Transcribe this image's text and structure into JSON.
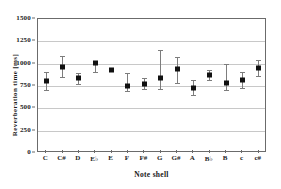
{
  "chart_data": {
    "type": "scatter",
    "title": "",
    "xlabel": "Note shell",
    "ylabel": "Reverberation time [ms]",
    "ylim": [
      0,
      1500
    ],
    "yticks": [
      0,
      250,
      500,
      750,
      1000,
      1250,
      1500
    ],
    "ytick_labels": [
      "0",
      "250",
      "500",
      "750",
      "1000",
      "1250",
      "1500"
    ],
    "grid": true,
    "legend": null,
    "categories": [
      "C",
      "C#",
      "D",
      "E♭",
      "E",
      "F",
      "F#",
      "G",
      "G#",
      "A",
      "B♭",
      "B",
      "c",
      "c#"
    ],
    "values": [
      805,
      965,
      835,
      1005,
      925,
      745,
      770,
      840,
      935,
      730,
      870,
      785,
      815,
      950
    ],
    "error_low": [
      705,
      855,
      775,
      910,
      915,
      690,
      715,
      720,
      785,
      645,
      820,
      700,
      730,
      860
    ],
    "error_high": [
      905,
      1090,
      895,
      1030,
      935,
      890,
      835,
      1150,
      1075,
      820,
      930,
      1000,
      905,
      1045
    ],
    "marker_color": "#111111",
    "errorbar_color": "#7d7d7d",
    "gridline_color": "#c8c8c8",
    "frame_color": "#6b6b6b"
  }
}
